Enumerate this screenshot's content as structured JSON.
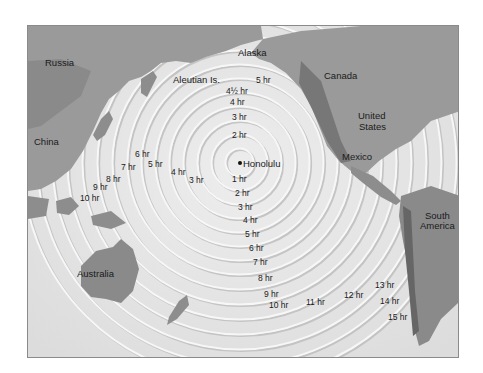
{
  "map": {
    "title": "Tsunami travel times from Honolulu",
    "origin": {
      "label": "Honolulu"
    },
    "colors": {
      "ocean": "#e4e4e4",
      "land": "#8f8f8f",
      "land_dark": "#6f6f6f",
      "ring_light": "#f4f4f4",
      "ring_shadow": "#bdbdbd",
      "frame": "#8a8a8a"
    },
    "places": [
      {
        "label": "Russia",
        "x": 44,
        "y": 62
      },
      {
        "label": "Alaska",
        "x": 237,
        "y": 52
      },
      {
        "label": "Aleutian Is.",
        "x": 172,
        "y": 79
      },
      {
        "label": "Canada",
        "x": 323,
        "y": 75
      },
      {
        "label": "United",
        "x": 357,
        "y": 115
      },
      {
        "label": "States",
        "x": 358,
        "y": 126
      },
      {
        "label": "China",
        "x": 33,
        "y": 141
      },
      {
        "label": "Mexico",
        "x": 341,
        "y": 151
      },
      {
        "label": "South",
        "x": 424,
        "y": 213
      },
      {
        "label": "America",
        "x": 419,
        "y": 222
      },
      {
        "label": "Australia",
        "x": 76,
        "y": 272
      }
    ],
    "north_labels": [
      {
        "label": "5 hr",
        "x": 255,
        "y": 78
      },
      {
        "label": "4½ hr",
        "x": 225,
        "y": 89
      },
      {
        "label": "4 hr",
        "x": 229,
        "y": 100
      },
      {
        "label": "3 hr",
        "x": 231,
        "y": 115
      },
      {
        "label": "2 hr",
        "x": 231,
        "y": 133
      }
    ],
    "south_labels": [
      {
        "label": "1 hr",
        "x": 231,
        "y": 177
      },
      {
        "label": "2 hr",
        "x": 234,
        "y": 191
      },
      {
        "label": "3 hr",
        "x": 237,
        "y": 205
      },
      {
        "label": "4 hr",
        "x": 242,
        "y": 218
      },
      {
        "label": "5 hr",
        "x": 244,
        "y": 232
      },
      {
        "label": "6 hr",
        "x": 248,
        "y": 246
      },
      {
        "label": "7 hr",
        "x": 252,
        "y": 260
      },
      {
        "label": "8 hr",
        "x": 257,
        "y": 276
      },
      {
        "label": "9 hr",
        "x": 263,
        "y": 292
      },
      {
        "label": "10 hr",
        "x": 268,
        "y": 303
      },
      {
        "label": "11 hr",
        "x": 305,
        "y": 300
      },
      {
        "label": "12 hr",
        "x": 343,
        "y": 293
      },
      {
        "label": "13 hr",
        "x": 374,
        "y": 283
      },
      {
        "label": "14 hr",
        "x": 379,
        "y": 299
      },
      {
        "label": "15 hr",
        "x": 387,
        "y": 315
      }
    ],
    "west_labels": [
      {
        "label": "3 hr",
        "x": 188,
        "y": 178
      },
      {
        "label": "4 hr",
        "x": 170,
        "y": 170
      },
      {
        "label": "5 hr",
        "x": 147,
        "y": 162
      },
      {
        "label": "6 hr",
        "x": 134,
        "y": 152
      },
      {
        "label": "7 hr",
        "x": 120,
        "y": 165
      },
      {
        "label": "8 hr",
        "x": 105,
        "y": 177
      },
      {
        "label": "9 hr",
        "x": 92,
        "y": 185
      },
      {
        "label": "10 hr",
        "x": 79,
        "y": 196
      }
    ]
  }
}
